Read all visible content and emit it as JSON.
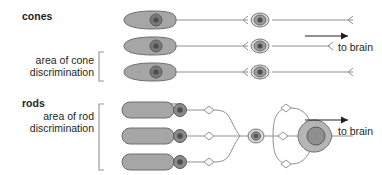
{
  "figure": {
    "background_color": "#ffffff",
    "cell_fill_color": "#a6a6a6",
    "cell_stroke_color": "#6d6d6d",
    "nucleus_dark_color": "#595959",
    "line_color": "#808080",
    "arrow_color": "#231f20",
    "text_color": "#231f20"
  },
  "labels": {
    "cones": "cones",
    "rods": "rods",
    "cone_area_line1": "area of cone",
    "cone_area_line2": "discrimination",
    "rod_area_line1": "area of rod",
    "rod_area_line2": "discrimination",
    "to_brain_cones": "to brain",
    "to_brain_rods": "to brain"
  },
  "cone_pathway": {
    "name": "cone-pathway",
    "description": "one-to-one wiring: each cone connects to its own bipolar cell and its own ganglion cell",
    "receptor_count": 3,
    "receptor_shape": "tapered-cone",
    "bipolar_count": 3,
    "convergence_ratio": "1:1",
    "rows": [
      {
        "row": 1,
        "y": 20
      },
      {
        "row": 2,
        "y": 46
      },
      {
        "row": 3,
        "y": 72
      }
    ]
  },
  "rod_pathway": {
    "name": "rod-pathway",
    "description": "many-to-one wiring: three rods converge on one bipolar cell, which converges with others on a single ganglion cell",
    "receptor_count": 3,
    "receptor_shape": "rounded-rod",
    "bipolar_count": 1,
    "ganglion_count": 1,
    "convergence_ratio": "many:1",
    "rows": [
      {
        "row": 1,
        "y": 110
      },
      {
        "row": 2,
        "y": 136
      },
      {
        "row": 3,
        "y": 162
      }
    ]
  },
  "brackets": {
    "cone_bracket": "[",
    "rod_bracket": "["
  }
}
